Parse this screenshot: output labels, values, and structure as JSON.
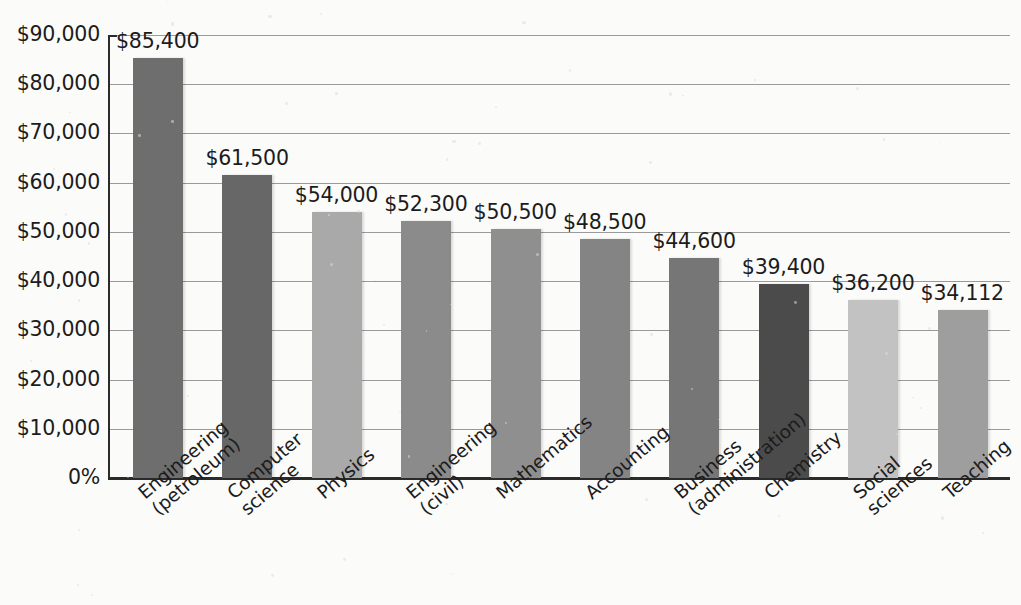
{
  "chart_data": {
    "type": "bar",
    "title": "",
    "xlabel": "",
    "ylabel": "",
    "ylim": [
      0,
      90000
    ],
    "grid": true,
    "legend": "none",
    "categories": [
      "Engineering (petroleum)",
      "Computer science",
      "Physics",
      "Engineering (civil)",
      "Mathematics",
      "Accounting",
      "Business (administration)",
      "Chemistry",
      "Social sciences",
      "Teaching"
    ],
    "category_lines": [
      [
        "Engineering",
        "(petroleum)"
      ],
      [
        "Computer",
        "science"
      ],
      [
        "Physics",
        ""
      ],
      [
        "Engineering",
        "(civil)"
      ],
      [
        "Mathematics",
        ""
      ],
      [
        "Accounting",
        ""
      ],
      [
        "Business",
        "(administration)"
      ],
      [
        "Chemistry",
        ""
      ],
      [
        "Social",
        "sciences"
      ],
      [
        "Teaching",
        ""
      ]
    ],
    "values": [
      85400,
      61500,
      54000,
      52300,
      50500,
      48500,
      44600,
      39400,
      36200,
      34112
    ],
    "value_labels": [
      "$85,400",
      "$61,500",
      "$54,000",
      "$52,300",
      "$50,500",
      "$48,500",
      "$44,600",
      "$39,400",
      "$36,200",
      "$34,112"
    ],
    "bar_colors": [
      "#6e6e6e",
      "#676767",
      "#a9a9a9",
      "#8b8b8b",
      "#8f8f8f",
      "#848484",
      "#767676",
      "#4b4b4b",
      "#c2c2c2",
      "#9e9e9e"
    ],
    "yticks": [
      "$90,000",
      "$80,000",
      "$70,000",
      "$60,000",
      "$50,000",
      "$40,000",
      "$30,000",
      "$20,000",
      "$10,000",
      "0%"
    ],
    "ytick_values": [
      90000,
      80000,
      70000,
      60000,
      50000,
      40000,
      30000,
      20000,
      10000,
      0
    ]
  }
}
